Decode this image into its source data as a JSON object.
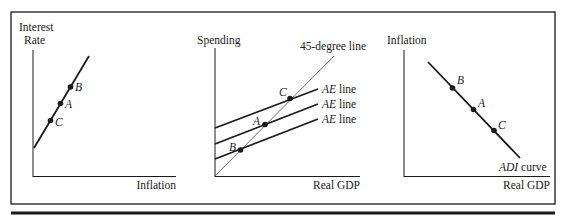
{
  "colors": {
    "ink": "#1a1a1a",
    "thin_line": "#555555",
    "background": "#ffffff"
  },
  "panels": [
    {
      "id": "mp-curve",
      "y_label_line1": "Interest",
      "y_label_line2": "Rate",
      "x_label": "Inflation",
      "curves": [
        {
          "name": "MP curve (upward sloping)",
          "label": ""
        }
      ],
      "points": [
        {
          "label": "B",
          "position": "highest"
        },
        {
          "label": "A",
          "position": "middle"
        },
        {
          "label": "C",
          "position": "lowest"
        }
      ]
    },
    {
      "id": "keynesian-cross",
      "y_label": "Spending",
      "x_label": "Real GDP",
      "line_45_label": "45-degree line",
      "ae_lines": [
        {
          "label_prefix": "AE",
          "label_suffix": " line",
          "level": "high",
          "intersection": "C"
        },
        {
          "label_prefix": "AE",
          "label_suffix": " line",
          "level": "middle",
          "intersection": "A"
        },
        {
          "label_prefix": "AE",
          "label_suffix": " line",
          "level": "low",
          "intersection": "B"
        }
      ],
      "points": [
        {
          "label": "C"
        },
        {
          "label": "A"
        },
        {
          "label": "B"
        }
      ]
    },
    {
      "id": "adi-curve",
      "y_label": "Inflation",
      "x_label": "Real GDP",
      "curve_label_prefix": "ADI",
      "curve_label_suffix": " curve",
      "points": [
        {
          "label": "B",
          "position": "upper-left"
        },
        {
          "label": "A",
          "position": "middle"
        },
        {
          "label": "C",
          "position": "lower-right"
        }
      ]
    }
  ]
}
